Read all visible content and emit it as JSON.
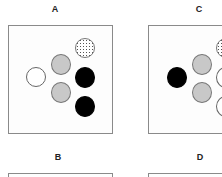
{
  "panels": [
    {
      "id": "A",
      "label": "A"
    },
    {
      "id": "B",
      "label": "B"
    },
    {
      "id": "C",
      "label": "C"
    },
    {
      "id": "D",
      "label": "D"
    }
  ],
  "legend_styles": {
    "white": "#ffffff",
    "gray": "#c8c8c8",
    "black": "#000000",
    "dotted": "stippled"
  }
}
